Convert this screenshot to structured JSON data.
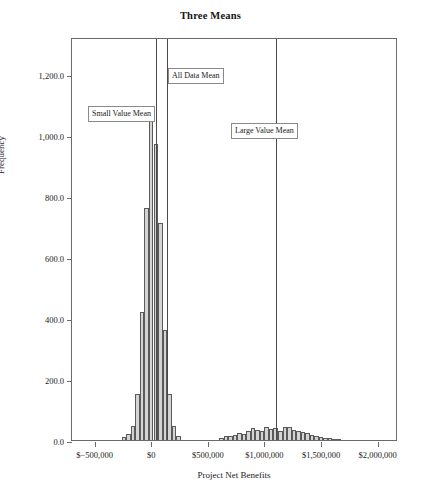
{
  "chart_data": {
    "type": "bar",
    "title": "Three Means",
    "xlabel": "Project Net Benefits",
    "ylabel": "Frequency",
    "grid": false,
    "legend": "none",
    "xlim": [
      -700000,
      2180000
    ],
    "ylim": [
      0,
      1320
    ],
    "xticks": [
      {
        "value": -500000,
        "label": "$−500,000"
      },
      {
        "value": 0,
        "label": "$0"
      },
      {
        "value": 500000,
        "label": "$500,000"
      },
      {
        "value": 1000000,
        "label": "$1,000,000"
      },
      {
        "value": 1500000,
        "label": "$1,500,000"
      },
      {
        "value": 2000000,
        "label": "$2,000,000"
      }
    ],
    "yticks": [
      {
        "value": 0,
        "label": "0.0"
      },
      {
        "value": 200,
        "label": "200.0"
      },
      {
        "value": 400,
        "label": "400.0"
      },
      {
        "value": 600,
        "label": "600.0"
      },
      {
        "value": 800,
        "label": "800.0"
      },
      {
        "value": 1000,
        "label": "1,000.0"
      },
      {
        "value": 1200,
        "label": "1,200.0"
      }
    ],
    "bin_width": 40000,
    "bars": [
      {
        "x": -240000,
        "value": 10
      },
      {
        "x": -200000,
        "value": 20
      },
      {
        "x": -160000,
        "value": 45
      },
      {
        "x": -120000,
        "value": 150
      },
      {
        "x": -80000,
        "value": 420
      },
      {
        "x": -40000,
        "value": 760
      },
      {
        "x": 0,
        "value": 1050
      },
      {
        "x": 40000,
        "value": 970
      },
      {
        "x": 80000,
        "value": 710
      },
      {
        "x": 120000,
        "value": 360
      },
      {
        "x": 160000,
        "value": 150
      },
      {
        "x": 200000,
        "value": 45
      },
      {
        "x": 240000,
        "value": 12
      },
      {
        "x": 620000,
        "value": 8
      },
      {
        "x": 660000,
        "value": 12
      },
      {
        "x": 700000,
        "value": 14
      },
      {
        "x": 740000,
        "value": 18
      },
      {
        "x": 780000,
        "value": 22
      },
      {
        "x": 820000,
        "value": 20
      },
      {
        "x": 860000,
        "value": 30
      },
      {
        "x": 900000,
        "value": 40
      },
      {
        "x": 940000,
        "value": 34
      },
      {
        "x": 980000,
        "value": 30
      },
      {
        "x": 1020000,
        "value": 44
      },
      {
        "x": 1060000,
        "value": 36
      },
      {
        "x": 1100000,
        "value": 40
      },
      {
        "x": 1140000,
        "value": 30
      },
      {
        "x": 1180000,
        "value": 44
      },
      {
        "x": 1220000,
        "value": 42
      },
      {
        "x": 1260000,
        "value": 34
      },
      {
        "x": 1300000,
        "value": 30
      },
      {
        "x": 1340000,
        "value": 26
      },
      {
        "x": 1380000,
        "value": 22
      },
      {
        "x": 1420000,
        "value": 16
      },
      {
        "x": 1460000,
        "value": 14
      },
      {
        "x": 1500000,
        "value": 10
      },
      {
        "x": 1540000,
        "value": 8
      },
      {
        "x": 1580000,
        "value": 6
      },
      {
        "x": 1620000,
        "value": 4
      },
      {
        "x": 1660000,
        "value": 3
      }
    ],
    "reference_lines": [
      {
        "name": "small-value-mean",
        "x": 40000,
        "label": "Small Value Mean"
      },
      {
        "name": "all-data-mean",
        "x": 140000,
        "label": "All Data Mean"
      },
      {
        "name": "large-value-mean",
        "x": 1100000,
        "label": "Large Value Mean"
      }
    ],
    "annotations": [
      {
        "name": "small-value-mean-label",
        "text": "Small Value Mean",
        "left": 16,
        "top": 67
      },
      {
        "name": "all-data-mean-label",
        "text": "All Data Mean",
        "left": 96,
        "top": 29
      },
      {
        "name": "large-value-mean-label",
        "text": "Large Value Mean",
        "left": 159,
        "top": 84
      }
    ]
  }
}
